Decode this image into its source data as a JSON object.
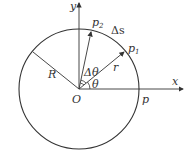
{
  "diagram": {
    "type": "circular motion geometry",
    "labels": {
      "x_axis": "x",
      "y_axis": "y",
      "origin": "O",
      "radius": "R",
      "position_vector": "r",
      "point_p": "p",
      "point_p1": "p",
      "point_p1_sub": "1",
      "point_p2": "p",
      "point_p2_sub": "2",
      "arc_length": "Δs",
      "angle": "θ",
      "angle_increment": "Δθ"
    },
    "colors": {
      "stroke": "#333333",
      "background": "#ffffff"
    }
  }
}
